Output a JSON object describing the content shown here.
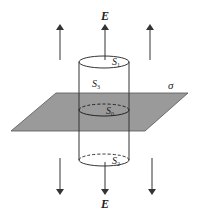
{
  "figure": {
    "field_label": "E",
    "plane_label": "σ",
    "surfaces": {
      "top": {
        "symbol": "S",
        "subscript": "1"
      },
      "side": {
        "symbol": "S",
        "subscript": "3"
      },
      "middle": {
        "symbol": "S",
        "subscript": "0"
      },
      "bottom": {
        "symbol": "S",
        "subscript": "2"
      }
    },
    "arrows_up_count": 3,
    "arrows_down_count": 3,
    "colors": {
      "plane_fill": "#9a9a9a",
      "line": "#333333"
    }
  }
}
